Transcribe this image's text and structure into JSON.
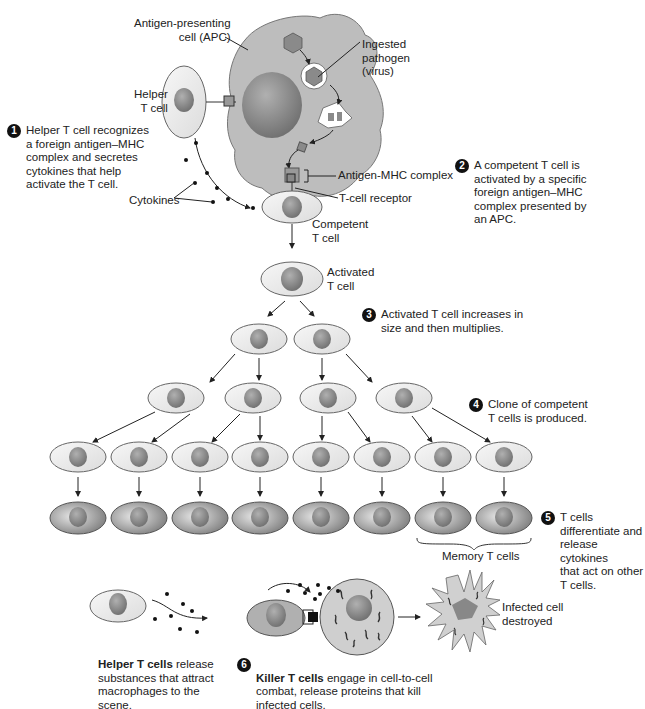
{
  "labels": {
    "apc": "Antigen-presenting\ncell (APC)",
    "ingested": "Ingested\npathogen\n(virus)",
    "helper": "Helper\nT cell",
    "cytokines": "Cytokines",
    "antigen_mhc": "Antigen-MHC complex",
    "tcr": "T-cell receptor",
    "competent": "Competent\nT cell",
    "activated": "Activated\nT cell",
    "memory": "Memory T cells",
    "infected_destroyed": "Infected cell\ndestroyed"
  },
  "steps": [
    {
      "num": "1",
      "text": "Helper T cell recognizes\na foreign antigen–MHC\ncomplex and secretes\ncytokines that help\nactivate the T cell."
    },
    {
      "num": "2",
      "text": "A competent T cell is\nactivated by a specific\nforeign antigen–MHC\ncomplex presented by\nan APC."
    },
    {
      "num": "3",
      "text": "Activated T cell increases in\nsize and then multiplies."
    },
    {
      "num": "4",
      "text": "Clone of competent\nT cells is produced."
    },
    {
      "num": "5",
      "text": "T cells\ndifferentiate and\nrelease cytokines\nthat act on other\nT cells."
    },
    {
      "num": "6",
      "bold": "Killer T cells",
      "text": " engage in cell-to-cell\ncombat, release proteins that kill\ninfected cells."
    }
  ],
  "helper_note": {
    "bold": "Helper T cells",
    "text": " release\nsubstances that attract\nmacrophages to the\nscene."
  },
  "colors": {
    "cell_fill": "#ececec",
    "cell_stroke": "#666666",
    "nucleus": "#8a8a8a",
    "apc_fill": "#bdbdbd",
    "diff_cell": "#9a9a9a",
    "text": "#222222"
  }
}
